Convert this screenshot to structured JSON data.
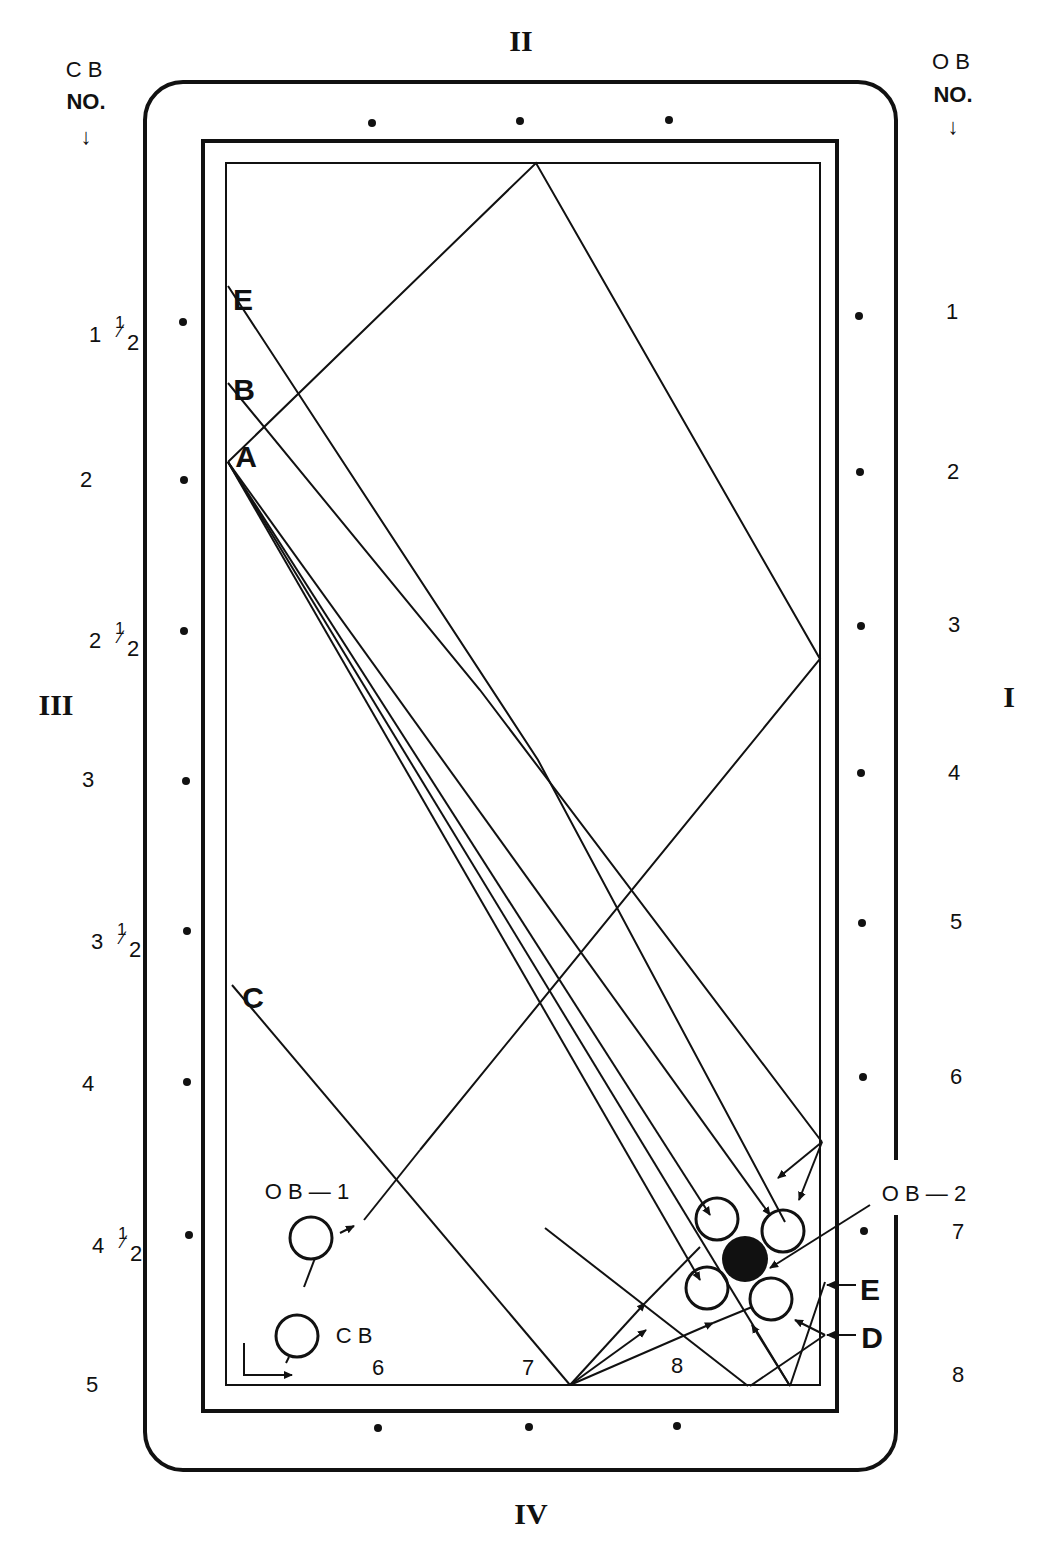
{
  "diagram": {
    "title_rails": {
      "top": "II",
      "right": "I",
      "bottom": "IV",
      "left": "III"
    },
    "cb_header": {
      "line1": "C B",
      "line2": "NO.",
      "arrow": "↓"
    },
    "ob_header": {
      "line1": "O B",
      "line2": "NO.",
      "arrow": "↓"
    },
    "cb_scale": [
      {
        "whole": "1",
        "num": "1",
        "den": "2",
        "y": 325
      },
      {
        "whole": "2",
        "y": 480
      },
      {
        "whole": "2",
        "num": "1",
        "den": "2",
        "y": 630
      },
      {
        "whole": "3",
        "y": 780
      },
      {
        "whole": "3",
        "num": "1",
        "den": "2",
        "y": 930
      },
      {
        "whole": "4",
        "y": 1083
      },
      {
        "whole": "4",
        "num": "1",
        "den": "2",
        "y": 1235
      },
      {
        "whole": "5",
        "y": 1385
      }
    ],
    "ob_scale": [
      {
        "label": "1",
        "y": 312
      },
      {
        "label": "2",
        "y": 472
      },
      {
        "label": "3",
        "y": 625
      },
      {
        "label": "4",
        "y": 773
      },
      {
        "label": "5",
        "y": 922
      },
      {
        "label": "6",
        "y": 1077
      },
      {
        "label": "7",
        "y": 1232
      },
      {
        "label": "8",
        "y": 1375
      }
    ],
    "bottom_scale": [
      {
        "label": "6",
        "x": 378
      },
      {
        "label": "7",
        "x": 528
      },
      {
        "label": "8",
        "x": 677
      }
    ],
    "path_labels": {
      "E_top": "E",
      "B": "B",
      "A": "A",
      "C": "C",
      "E_right": "E",
      "D": "D"
    },
    "ball_labels": {
      "ob1": "O B — 1",
      "ob2": "O B — 2",
      "cb": "C B"
    },
    "colors": {
      "ink": "#111111",
      "paper": "#ffffff"
    }
  }
}
